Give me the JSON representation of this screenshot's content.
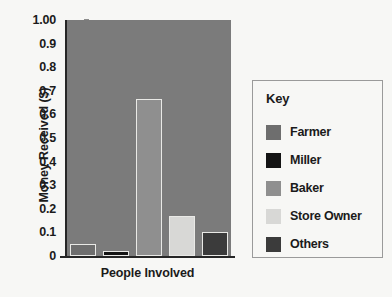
{
  "chart_data": {
    "type": "bar",
    "title": "",
    "xlabel": "People Involved",
    "ylabel": "Money Received ($)",
    "categories": [
      "Farmer",
      "Miller",
      "Baker",
      "Store Owner",
      "Others"
    ],
    "values": [
      0.05,
      0.02,
      0.665,
      0.17,
      0.1
    ],
    "ylim": [
      0,
      1.0
    ],
    "yticks": [
      "0",
      "0.1",
      "0.2",
      "0.3",
      "0.4",
      "0.5",
      "0.6",
      "0.7",
      "0.8",
      "0.9",
      "1.00"
    ],
    "ytick_values": [
      0,
      0.1,
      0.2,
      0.3,
      0.4,
      0.5,
      0.6,
      0.7,
      0.8,
      0.9,
      1.0
    ],
    "grid": false,
    "legend_position": "right",
    "plot_background": "#7b7b7b",
    "bar_edge_color": "#e9e9e6",
    "bar_colors": [
      "#6e6e6e",
      "#141414",
      "#8f8f8f",
      "#d8d8d6",
      "#3b3b3b"
    ]
  },
  "legend": {
    "title": "Key",
    "items": [
      {
        "label": "Farmer",
        "color": "#6e6e6e"
      },
      {
        "label": "Miller",
        "color": "#141414"
      },
      {
        "label": "Baker",
        "color": "#8f8f8f"
      },
      {
        "label": "Store Owner",
        "color": "#d8d8d6"
      },
      {
        "label": "Others",
        "color": "#3b3b3b"
      }
    ]
  }
}
